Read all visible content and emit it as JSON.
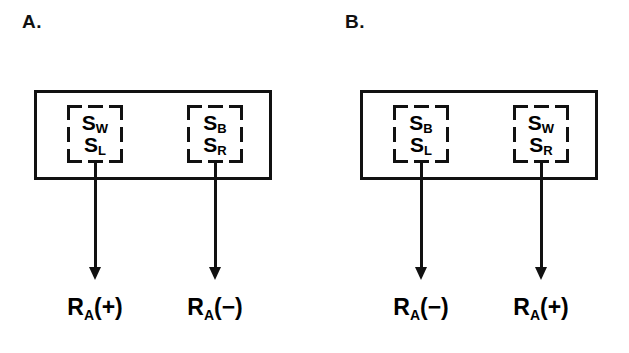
{
  "figure": {
    "width": 629,
    "height": 353,
    "background": "#ffffff",
    "ink_color": "#111111",
    "type": "diagram"
  },
  "panels": [
    {
      "id": "A",
      "label": "A.",
      "label_x": 22,
      "label_y": 12,
      "outer_box": {
        "x": 34,
        "y": 90,
        "width": 238,
        "height": 90
      },
      "compounds": [
        {
          "id": "A-left",
          "box": {
            "x": 67,
            "y": 105,
            "width": 56,
            "height": 58
          },
          "stimuli": [
            {
              "symbol": "S",
              "subscript": "W"
            },
            {
              "symbol": "S",
              "subscript": "L"
            }
          ],
          "arrow": {
            "x": 95,
            "y_start": 160,
            "y_end": 280
          },
          "response": {
            "symbol": "R",
            "subscript": "A",
            "valence": "(+)",
            "x": 95,
            "y": 296
          }
        },
        {
          "id": "A-right",
          "box": {
            "x": 187,
            "y": 105,
            "width": 56,
            "height": 58
          },
          "stimuli": [
            {
              "symbol": "S",
              "subscript": "B"
            },
            {
              "symbol": "S",
              "subscript": "R"
            }
          ],
          "arrow": {
            "x": 215,
            "y_start": 160,
            "y_end": 280
          },
          "response": {
            "symbol": "R",
            "subscript": "A",
            "valence": "(−)",
            "x": 215,
            "y": 296
          }
        }
      ]
    },
    {
      "id": "B",
      "label": "B.",
      "label_x": 345,
      "label_y": 12,
      "outer_box": {
        "x": 360,
        "y": 90,
        "width": 238,
        "height": 90
      },
      "compounds": [
        {
          "id": "B-left",
          "box": {
            "x": 393,
            "y": 105,
            "width": 56,
            "height": 58
          },
          "stimuli": [
            {
              "symbol": "S",
              "subscript": "B"
            },
            {
              "symbol": "S",
              "subscript": "L"
            }
          ],
          "arrow": {
            "x": 421,
            "y_start": 160,
            "y_end": 280
          },
          "response": {
            "symbol": "R",
            "subscript": "A",
            "valence": "(−)",
            "x": 421,
            "y": 296
          }
        },
        {
          "id": "B-right",
          "box": {
            "x": 513,
            "y": 105,
            "width": 56,
            "height": 58
          },
          "stimuli": [
            {
              "symbol": "S",
              "subscript": "W"
            },
            {
              "symbol": "S",
              "subscript": "R"
            }
          ],
          "arrow": {
            "x": 541,
            "y_start": 160,
            "y_end": 280
          },
          "response": {
            "symbol": "R",
            "subscript": "A",
            "valence": "(+)",
            "x": 541,
            "y": 296
          }
        }
      ]
    }
  ]
}
